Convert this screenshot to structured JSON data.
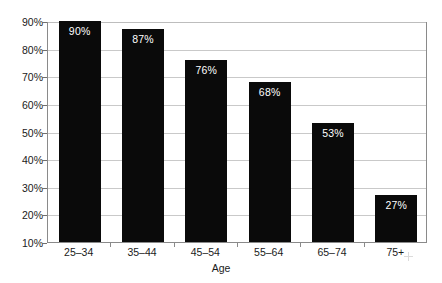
{
  "chart_data": {
    "type": "bar",
    "title": "",
    "subtitle": "",
    "xlabel": "Age",
    "ylabel": "",
    "categories": [
      "25–34",
      "35–44",
      "45–54",
      "55–64",
      "65–74",
      "75+"
    ],
    "values": [
      90,
      87,
      76,
      68,
      53,
      27
    ],
    "data_labels": [
      "90%",
      "87%",
      "76%",
      "68%",
      "53%",
      "27%"
    ],
    "ylim": [
      10,
      90
    ],
    "ytick_labels": [
      "90%",
      "80%",
      "70%",
      "60%",
      "50%",
      "40%",
      "30%",
      "20%",
      "10%"
    ],
    "ytick_values": [
      90,
      80,
      70,
      60,
      50,
      40,
      30,
      20,
      10
    ],
    "grid": "horizontal",
    "legend": "none",
    "series": [
      {
        "name": "",
        "values": [
          90,
          87,
          76,
          68,
          53,
          27
        ]
      }
    ],
    "colors": {
      "bar_fill": "#0a0a0a",
      "data_label_text": "#ffffff",
      "gridline": "#c9c9c9",
      "axis_line": "#8a8a8a",
      "axis_text": "#1a1a1a",
      "background": "#ffffff"
    }
  }
}
